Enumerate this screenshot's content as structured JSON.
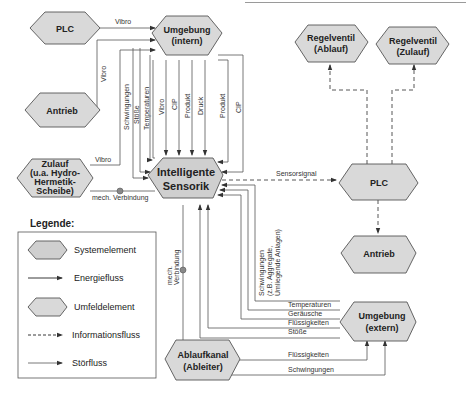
{
  "nodes": {
    "plc_left": "PLC",
    "umgebung_intern": [
      "Umgebung",
      "(intern)"
    ],
    "antrieb_left": "Antrieb",
    "zulauf": [
      "Zulauf",
      "(u.a. Hydro-",
      "Hermetik-",
      "Scheibe)"
    ],
    "sensorik": [
      "Intelligente",
      "Sensorik"
    ],
    "regelventil_ablauf": [
      "Regelventil",
      "(Ablauf)"
    ],
    "regelventil_zulauf": [
      "Regelventil",
      "(Zulauf)"
    ],
    "plc_right": "PLC",
    "antrieb_right": "Antrieb",
    "umgebung_extern": [
      "Umgebung",
      "(extern)"
    ],
    "ablaufkanal": [
      "Ablaufkanal",
      "(Ableiter)"
    ]
  },
  "edges": {
    "plc_to_umgebung": "Vibro",
    "antrieb_to_umgebung": "Vibro",
    "zulauf_to_sensorik": "Vibro",
    "zulauf_mech": "mech. Verbindung",
    "ablauf_mech": [
      "mech.",
      "Verbindung"
    ],
    "sensorsignal": "Sensorsignal",
    "intern_flows": [
      "Schwingungen",
      "Stöße",
      "Temperaturen",
      "Vibro",
      "CIP",
      "Produkt",
      "Druck",
      "Produkt",
      "CIP"
    ],
    "extern_schwingungen": [
      "Schwingungen",
      "(z.B. Aggregate,",
      "Umliegende Anlagen)"
    ],
    "extern_flows": [
      "Temperaturen",
      "Geräusche",
      "Flüssigkeiten",
      "Stöße"
    ],
    "ablauf_flows": [
      "Flüssigkeiten",
      "Schwingungen"
    ]
  },
  "legend": {
    "title": "Legende:",
    "items": [
      "Systemelement",
      "Energiefluss",
      "Umfeldelement",
      "Informationsfluss",
      "Störfluss"
    ]
  }
}
